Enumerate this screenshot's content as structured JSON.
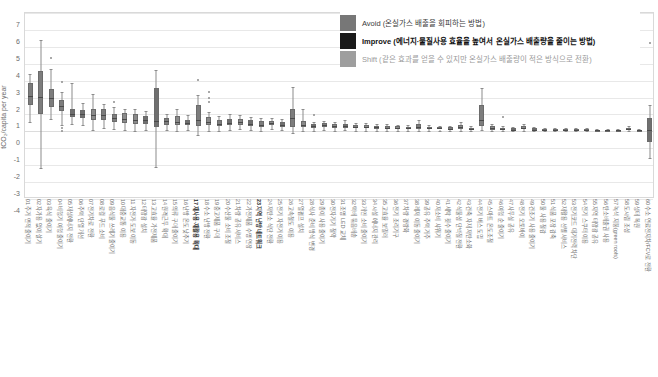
{
  "chart_data": {
    "type": "boxplot",
    "title": "",
    "xlabel": "",
    "ylabel": "tCO₂/capita per year",
    "ylim": [
      -4,
      7
    ],
    "yticks": [
      7,
      6,
      5,
      4,
      3,
      2,
      1,
      0,
      -1,
      -2,
      -3,
      -4
    ],
    "grid": true,
    "legend_position": "top-right",
    "legend": [
      {
        "key": "avoid",
        "label": "Avoid (온실가스 배출을 회피하는 방법)",
        "color": "#777777"
      },
      {
        "key": "improve",
        "label": "Improve (에너지·물질사용 효율을 높여서 온실가스 배출량을 줄이는 방법)",
        "color": "#1a1a1a"
      },
      {
        "key": "shift",
        "label": "Shift (같은 효과를 얻을 수 있지만 온실가스 배출량이 적은 방식으로 전환)",
        "color": "#9e9e9e"
      }
    ],
    "categories": [
      "01 주거 면적 줄이기",
      "02 자가용 없이 살기",
      "03 육식 줄이기",
      "04 비행기 여행 줄이기",
      "05 재생에너지 전환",
      "06 주택 단열 개선",
      "07 전기차로 전환",
      "08 로컬 푸드 소비",
      "09 음식물 쓰레기 줄이기",
      "10 대중교통 이용",
      "11 자전거·도보 이동",
      "12 태양광 설치",
      "13 고효율 가전제품",
      "14 원격근무 확대",
      "15 의류 구매 줄이기",
      "16 난방 온도 낮추기",
      "17 재사용·재활용 확대",
      "18 수소 난방 전환",
      "19 중고제품 구매",
      "20 수산물 소비 조절",
      "21 차량 공유 서비스",
      "22 가전제품 수명 연장",
      "23 지역 난방 네트워크",
      "24 저탄소 식단 전환",
      "25 전기 자전거 이용",
      "26 고속철도 이용",
      "27 열펌프 설치",
      "28 식사 준비 방식 변경",
      "29 종이 사용 줄이기",
      "30 전자기기 절약",
      "31 조명 LED 교체",
      "32 택배 묶음배송",
      "33 개인 소비 줄이기",
      "34 시설 에너지 관리",
      "35 고효율 보일러",
      "36 전기 조리기구",
      "37 차량 경량화",
      "38 레저 이동 줄이기",
      "39 공유 주택 거주",
      "40 저소비 샤워기",
      "41 세탁 횟수 줄이기",
      "42 식물성 단백질 전환",
      "43 건축 자재 저탄소화",
      "44 전기 버스 도입",
      "45 스마트 온도조절",
      "46 여행 순 줄이기",
      "47 사무실 공유",
      "48 전기 오토바이",
      "49 건조기 사용 줄이기",
      "50 물 사용 절감",
      "51 식품 포장 감축",
      "52 재활용 선별 서비스",
      "53 전기코드 대기전력 차단",
      "54 전기 스쿠터 이용",
      "55 지역 태양광 공유",
      "56 탄소배출권 사용",
      "57 녹색 지붕(green roofs)",
      "58 도시림 조성",
      "59 생태 복원",
      "60 수소 연료전지차/FCV로 전환"
    ],
    "series": [
      {
        "cat": 0,
        "group": "avoid",
        "min": 0.55,
        "q1": 1.55,
        "med": 2.1,
        "q3": 2.85,
        "max": 3.4,
        "outliers": []
      },
      {
        "cat": 1,
        "group": "avoid",
        "min": -2.15,
        "q1": 1.0,
        "med": 2.05,
        "q3": 3.55,
        "max": 5.4,
        "outliers": []
      },
      {
        "cat": 2,
        "group": "avoid",
        "min": 0.75,
        "q1": 1.45,
        "med": 1.95,
        "q3": 2.5,
        "max": 3.7,
        "outliers": [
          4.35
        ]
      },
      {
        "cat": 3,
        "group": "avoid",
        "min": 0.4,
        "q1": 1.2,
        "med": 1.5,
        "q3": 1.85,
        "max": 2.35,
        "outliers": [
          2.9,
          0.2,
          0.05
        ]
      },
      {
        "cat": 4,
        "group": "improve",
        "min": 0.45,
        "q1": 0.85,
        "med": 1.05,
        "q3": 1.3,
        "max": 2.85,
        "outliers": []
      },
      {
        "cat": 5,
        "group": "improve",
        "min": 0.35,
        "q1": 0.8,
        "med": 1.0,
        "q3": 1.25,
        "max": 1.7,
        "outliers": []
      },
      {
        "cat": 6,
        "group": "shift",
        "min": 0.1,
        "q1": 0.65,
        "med": 0.95,
        "q3": 1.35,
        "max": 2.2,
        "outliers": []
      },
      {
        "cat": 7,
        "group": "avoid",
        "min": 0.2,
        "q1": 0.7,
        "med": 0.95,
        "q3": 1.3,
        "max": 1.6,
        "outliers": []
      },
      {
        "cat": 8,
        "group": "avoid",
        "min": 0.15,
        "q1": 0.55,
        "med": 0.8,
        "q3": 1.05,
        "max": 1.45,
        "outliers": [
          1.75
        ]
      },
      {
        "cat": 9,
        "group": "shift",
        "min": 0.1,
        "q1": 0.5,
        "med": 0.75,
        "q3": 1.1,
        "max": 1.35,
        "outliers": []
      },
      {
        "cat": 10,
        "group": "shift",
        "min": 0.05,
        "q1": 0.45,
        "med": 0.7,
        "q3": 1.0,
        "max": 1.3,
        "outliers": []
      },
      {
        "cat": 11,
        "group": "improve",
        "min": 0.1,
        "q1": 0.45,
        "med": 0.65,
        "q3": 0.9,
        "max": 1.2,
        "outliers": []
      },
      {
        "cat": 12,
        "group": "improve",
        "min": -2.1,
        "q1": 0.25,
        "med": 0.6,
        "q3": 2.55,
        "max": 3.65,
        "outliers": []
      },
      {
        "cat": 13,
        "group": "avoid",
        "min": 0.1,
        "q1": 0.4,
        "med": 0.6,
        "q3": 0.8,
        "max": 1.05,
        "outliers": []
      },
      {
        "cat": 14,
        "group": "shift",
        "min": 0.05,
        "q1": 0.35,
        "med": 0.55,
        "q3": 0.9,
        "max": 1.35,
        "outliers": []
      },
      {
        "cat": 15,
        "group": "improve",
        "min": 0.1,
        "q1": 0.35,
        "med": 0.5,
        "q3": 0.7,
        "max": 0.95,
        "outliers": []
      },
      {
        "cat": 16,
        "group": "avoid",
        "min": -0.2,
        "q1": 0.3,
        "med": 0.7,
        "q3": 1.55,
        "max": 2.15,
        "outliers": [
          3.05
        ]
      },
      {
        "cat": 17,
        "group": "shift",
        "min": 0.05,
        "q1": 0.35,
        "med": 0.55,
        "q3": 0.85,
        "max": 1.15,
        "outliers": [
          1.95,
          1.75,
          2.35
        ]
      },
      {
        "cat": 18,
        "group": "avoid",
        "min": 0.05,
        "q1": 0.3,
        "med": 0.45,
        "q3": 0.65,
        "max": 0.9,
        "outliers": []
      },
      {
        "cat": 19,
        "group": "improve",
        "min": 0.1,
        "q1": 0.35,
        "med": 0.5,
        "q3": 0.75,
        "max": 1.0,
        "outliers": []
      },
      {
        "cat": 20,
        "group": "shift",
        "min": 0.15,
        "q1": 0.4,
        "med": 0.55,
        "q3": 0.75,
        "max": 0.95,
        "outliers": []
      },
      {
        "cat": 21,
        "group": "improve",
        "min": 0.1,
        "q1": 0.3,
        "med": 0.45,
        "q3": 0.65,
        "max": 0.85,
        "outliers": []
      },
      {
        "cat": 22,
        "group": "avoid",
        "min": 0.05,
        "q1": 0.25,
        "med": 0.4,
        "q3": 0.6,
        "max": 0.8,
        "outliers": []
      },
      {
        "cat": 23,
        "group": "shift",
        "min": 0.15,
        "q1": 0.35,
        "med": 0.48,
        "q3": 0.62,
        "max": 0.8,
        "outliers": []
      },
      {
        "cat": 24,
        "group": "improve",
        "min": 0.1,
        "q1": 0.28,
        "med": 0.4,
        "q3": 0.55,
        "max": 0.72,
        "outliers": []
      },
      {
        "cat": 25,
        "group": "avoid",
        "min": -0.1,
        "q1": 0.25,
        "med": 0.8,
        "q3": 1.35,
        "max": 2.6,
        "outliers": []
      },
      {
        "cat": 26,
        "group": "shift",
        "min": 0.05,
        "q1": 0.25,
        "med": 0.4,
        "q3": 0.6,
        "max": 1.35,
        "outliers": []
      },
      {
        "cat": 27,
        "group": "improve",
        "min": 0.05,
        "q1": 0.2,
        "med": 0.3,
        "q3": 0.42,
        "max": 0.55,
        "outliers": [
          0.95
        ]
      },
      {
        "cat": 28,
        "group": "avoid",
        "min": 0.1,
        "q1": 0.25,
        "med": 0.35,
        "q3": 0.48,
        "max": 0.62,
        "outliers": []
      },
      {
        "cat": 29,
        "group": "shift",
        "min": 0.05,
        "q1": 0.2,
        "med": 0.3,
        "q3": 0.42,
        "max": 0.55,
        "outliers": []
      },
      {
        "cat": 30,
        "group": "improve",
        "min": 0.08,
        "q1": 0.22,
        "med": 0.32,
        "q3": 0.45,
        "max": 0.7,
        "outliers": []
      },
      {
        "cat": 31,
        "group": "avoid",
        "min": 0.05,
        "q1": 0.18,
        "med": 0.28,
        "q3": 0.4,
        "max": 0.52,
        "outliers": []
      },
      {
        "cat": 32,
        "group": "shift",
        "min": 0.05,
        "q1": 0.18,
        "med": 0.26,
        "q3": 0.36,
        "max": 0.48,
        "outliers": []
      },
      {
        "cat": 33,
        "group": "improve",
        "min": 0.05,
        "q1": 0.16,
        "med": 0.24,
        "q3": 0.34,
        "max": 0.45,
        "outliers": []
      },
      {
        "cat": 34,
        "group": "avoid",
        "min": 0.04,
        "q1": 0.15,
        "med": 0.22,
        "q3": 0.32,
        "max": 0.42,
        "outliers": []
      },
      {
        "cat": 35,
        "group": "shift",
        "min": 0.04,
        "q1": 0.14,
        "med": 0.21,
        "q3": 0.3,
        "max": 0.4,
        "outliers": []
      },
      {
        "cat": 36,
        "group": "improve",
        "min": 0.03,
        "q1": 0.12,
        "med": 0.19,
        "q3": 0.28,
        "max": 0.38,
        "outliers": []
      },
      {
        "cat": 37,
        "group": "avoid",
        "min": 0.05,
        "q1": 0.16,
        "med": 0.28,
        "q3": 0.45,
        "max": 0.7,
        "outliers": []
      },
      {
        "cat": 38,
        "group": "shift",
        "min": 0.03,
        "q1": 0.12,
        "med": 0.18,
        "q3": 0.26,
        "max": 0.35,
        "outliers": []
      },
      {
        "cat": 39,
        "group": "improve",
        "min": 0.03,
        "q1": 0.11,
        "med": 0.17,
        "q3": 0.25,
        "max": 0.33,
        "outliers": []
      },
      {
        "cat": 40,
        "group": "avoid",
        "min": 0.02,
        "q1": 0.1,
        "med": 0.16,
        "q3": 0.23,
        "max": 0.31,
        "outliers": []
      },
      {
        "cat": 41,
        "group": "shift",
        "min": 0.05,
        "q1": 0.15,
        "med": 0.24,
        "q3": 0.38,
        "max": 0.58,
        "outliers": []
      },
      {
        "cat": 42,
        "group": "improve",
        "min": 0.02,
        "q1": 0.09,
        "med": 0.15,
        "q3": 0.22,
        "max": 0.3,
        "outliers": []
      },
      {
        "cat": 43,
        "group": "avoid",
        "min": 0.1,
        "q1": 0.3,
        "med": 0.7,
        "q3": 1.55,
        "max": 2.55,
        "outliers": []
      },
      {
        "cat": 44,
        "group": "shift",
        "min": 0.02,
        "q1": 0.1,
        "med": 0.18,
        "q3": 0.3,
        "max": 0.42,
        "outliers": []
      },
      {
        "cat": 45,
        "group": "improve",
        "min": 0.02,
        "q1": 0.08,
        "med": 0.14,
        "q3": 0.22,
        "max": 0.3,
        "outliers": [
          0.85
        ]
      },
      {
        "cat": 46,
        "group": "avoid",
        "min": 0.01,
        "q1": 0.06,
        "med": 0.11,
        "q3": 0.17,
        "max": 0.24,
        "outliers": []
      },
      {
        "cat": 47,
        "group": "shift",
        "min": 0.03,
        "q1": 0.12,
        "med": 0.2,
        "q3": 0.32,
        "max": 0.45,
        "outliers": []
      },
      {
        "cat": 48,
        "group": "improve",
        "min": 0.01,
        "q1": 0.06,
        "med": 0.11,
        "q3": 0.17,
        "max": 0.23,
        "outliers": []
      },
      {
        "cat": 49,
        "group": "avoid",
        "min": 0.01,
        "q1": 0.05,
        "med": 0.1,
        "q3": 0.15,
        "max": 0.21,
        "outliers": []
      },
      {
        "cat": 50,
        "group": "shift",
        "min": 0.01,
        "q1": 0.05,
        "med": 0.09,
        "q3": 0.14,
        "max": 0.2,
        "outliers": []
      },
      {
        "cat": 51,
        "group": "improve",
        "min": 0.01,
        "q1": 0.05,
        "med": 0.09,
        "q3": 0.14,
        "max": 0.19,
        "outliers": []
      },
      {
        "cat": 52,
        "group": "avoid",
        "min": 0.01,
        "q1": 0.04,
        "med": 0.08,
        "q3": 0.13,
        "max": 0.18,
        "outliers": []
      },
      {
        "cat": 53,
        "group": "shift",
        "min": 0.01,
        "q1": 0.04,
        "med": 0.08,
        "q3": 0.12,
        "max": 0.17,
        "outliers": []
      },
      {
        "cat": 54,
        "group": "improve",
        "min": 0.01,
        "q1": 0.04,
        "med": 0.07,
        "q3": 0.11,
        "max": 0.16,
        "outliers": []
      },
      {
        "cat": 55,
        "group": "avoid",
        "min": 0.01,
        "q1": 0.03,
        "med": 0.07,
        "q3": 0.11,
        "max": 0.15,
        "outliers": []
      },
      {
        "cat": 56,
        "group": "shift",
        "min": 0.01,
        "q1": 0.03,
        "med": 0.06,
        "q3": 0.1,
        "max": 0.14,
        "outliers": []
      },
      {
        "cat": 57,
        "group": "improve",
        "min": 0.02,
        "q1": 0.08,
        "med": 0.14,
        "q3": 0.22,
        "max": 0.3,
        "outliers": []
      },
      {
        "cat": 58,
        "group": "avoid",
        "min": 0.01,
        "q1": 0.03,
        "med": 0.06,
        "q3": 0.09,
        "max": 0.13,
        "outliers": []
      },
      {
        "cat": 59,
        "group": "improve",
        "min": -1.55,
        "q1": -0.6,
        "med": 0.1,
        "q3": 0.8,
        "max": 1.55,
        "outliers": [
          5.25
        ]
      }
    ]
  },
  "colors": {
    "box_fill": "#7d7d7d",
    "box_edge": "#6b6b6b",
    "median": "#4a4a4a",
    "whisker": "#8c8c8c",
    "grid": "#e8e8e8",
    "frame": "#d9d9d9",
    "background": "#ffffff"
  }
}
